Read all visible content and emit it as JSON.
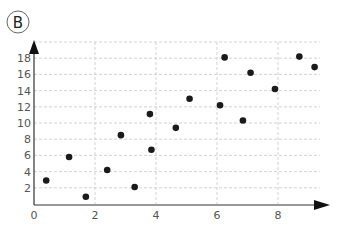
{
  "panel_label": "B",
  "chart_data": {
    "type": "scatter",
    "title": "",
    "xlabel": "",
    "ylabel": "",
    "xlim": [
      0,
      9.5
    ],
    "ylim": [
      0,
      19
    ],
    "x_ticks": [
      0,
      2,
      4,
      6,
      8
    ],
    "y_ticks": [
      2,
      4,
      6,
      8,
      10,
      12,
      14,
      16,
      18
    ],
    "grid": true,
    "legend": null,
    "points": [
      {
        "x": 0.4,
        "y": 2.9
      },
      {
        "x": 1.15,
        "y": 5.8
      },
      {
        "x": 1.7,
        "y": 0.9
      },
      {
        "x": 2.4,
        "y": 4.2
      },
      {
        "x": 2.85,
        "y": 8.5
      },
      {
        "x": 3.3,
        "y": 2.1
      },
      {
        "x": 3.8,
        "y": 11.1
      },
      {
        "x": 3.85,
        "y": 6.7
      },
      {
        "x": 4.65,
        "y": 9.4
      },
      {
        "x": 5.1,
        "y": 13.0
      },
      {
        "x": 6.1,
        "y": 12.2
      },
      {
        "x": 6.25,
        "y": 18.1
      },
      {
        "x": 6.85,
        "y": 10.3
      },
      {
        "x": 7.1,
        "y": 16.2
      },
      {
        "x": 7.9,
        "y": 14.2
      },
      {
        "x": 8.7,
        "y": 18.2
      },
      {
        "x": 9.2,
        "y": 16.9
      }
    ]
  },
  "colors": {
    "point": "#1a1a1a",
    "axis": "#333333",
    "grid": "#c8c8c8",
    "label": "#555555"
  }
}
